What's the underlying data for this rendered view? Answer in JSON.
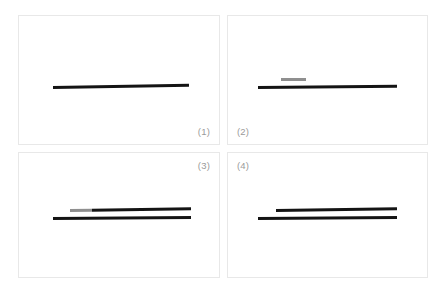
{
  "figure": {
    "background_color": "#ffffff",
    "panel_border_color": "#e8e8e8",
    "label_color": "#9a9a9a",
    "line_dark_color": "#141414",
    "line_gray_color": "#8f8f8f"
  },
  "panels": [
    {
      "label": "(1)",
      "label_position": "bottom-right",
      "lines": [
        {
          "name": "line-primary",
          "segments": [
            {
              "color": "#141414",
              "length_pct": 100
            }
          ]
        }
      ]
    },
    {
      "label": "(2)",
      "label_position": "bottom-left",
      "lines": [
        {
          "name": "line-upper-fragment",
          "segments": [
            {
              "color": "#8f8f8f",
              "length_pct": 100
            }
          ]
        },
        {
          "name": "line-primary",
          "segments": [
            {
              "color": "#141414",
              "length_pct": 100
            }
          ]
        }
      ]
    },
    {
      "label": "(3)",
      "label_position": "top-right",
      "lines": [
        {
          "name": "line-upper",
          "segments": [
            {
              "color": "#8f8f8f",
              "length_pct": 18
            },
            {
              "color": "#141414",
              "length_pct": 82
            }
          ]
        },
        {
          "name": "line-lower",
          "segments": [
            {
              "color": "#141414",
              "length_pct": 100
            }
          ]
        }
      ]
    },
    {
      "label": "(4)",
      "label_position": "top-left",
      "lines": [
        {
          "name": "line-upper",
          "segments": [
            {
              "color": "#141414",
              "length_pct": 100
            }
          ]
        },
        {
          "name": "line-lower",
          "segments": [
            {
              "color": "#141414",
              "length_pct": 100
            }
          ]
        }
      ]
    }
  ]
}
